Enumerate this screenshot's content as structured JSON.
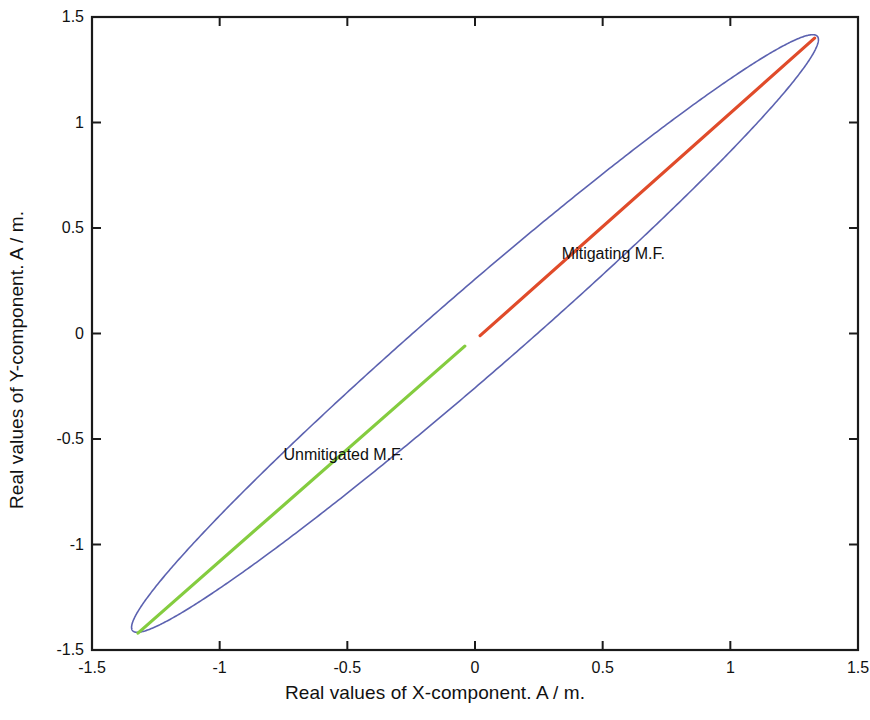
{
  "chart_data": {
    "type": "line",
    "title": "",
    "xlabel": "Real values of X-component. A / m.",
    "ylabel": "Real values of Y-component. A / m.",
    "xlim": [
      -1.5,
      1.5
    ],
    "ylim": [
      -1.5,
      1.5
    ],
    "xticks": [
      "-1.5",
      "-1",
      "-0.5",
      "0",
      "0.5",
      "1",
      "1.5"
    ],
    "xtick_values": [
      -1.5,
      -1,
      -0.5,
      0,
      0.5,
      1,
      1.5
    ],
    "yticks": [
      "1.5",
      "1",
      "0.5",
      "0",
      "-0.5",
      "-1",
      "-1.5"
    ],
    "ytick_values": [
      1.5,
      1,
      0.5,
      0,
      -0.5,
      -1,
      -1.5
    ],
    "grid": false,
    "legend_position": "inline-annotations",
    "series": [
      {
        "name": "Magnetic field locus ellipse",
        "type": "closed-curve",
        "color": "#5c62b0",
        "linewidth": 1.6,
        "description": "Narrow tilted ellipse (Lissajous locus) with major axis along the y = x diagonal",
        "ellipse": {
          "center_x": 0.0,
          "center_y": 0.0,
          "semi_major": 1.945,
          "semi_minor": 0.178,
          "rotation_deg": 46.5
        },
        "extreme_points": [
          {
            "x": 1.33,
            "y": 1.41
          },
          {
            "x": -1.34,
            "y": -1.43
          }
        ]
      },
      {
        "name": "Mitigating M.F.",
        "type": "line",
        "color": "#e04b2a",
        "linewidth": 3.2,
        "points": [
          {
            "x": 0.02,
            "y": -0.01
          },
          {
            "x": 1.33,
            "y": 1.4
          }
        ]
      },
      {
        "name": "Unmitigated M.F.",
        "type": "line",
        "color": "#84cc3f",
        "linewidth": 3.2,
        "points": [
          {
            "x": -1.32,
            "y": -1.42
          },
          {
            "x": -0.04,
            "y": -0.06
          }
        ]
      }
    ],
    "annotations": [
      {
        "text": "Mitigating M.F.",
        "x": 0.34,
        "y": 0.37,
        "anchor": "start",
        "color": "#101010"
      },
      {
        "text": "Unmitigated M.F.",
        "x": -0.75,
        "y": -0.58,
        "anchor": "start",
        "color": "#101010"
      }
    ],
    "colors": {
      "ellipse": "#5c62b0",
      "mitigating": "#e04b2a",
      "unmitigated": "#84cc3f",
      "axis": "#1a1a1a",
      "background": "#ffffff"
    }
  },
  "axis_titles": {
    "x": "Real values of X-component. A / m.",
    "y": "Real values of Y-component. A / m."
  }
}
